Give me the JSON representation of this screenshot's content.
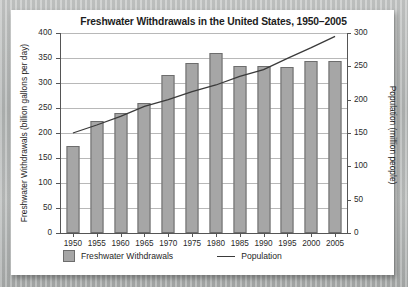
{
  "chart_data": {
    "type": "bar",
    "title": "Freshwater Withdrawals in the United States, 1950–2005",
    "xlabel": "",
    "ylabel": "Freshwater Withdrawals (billion gallons per day)",
    "y2label": "Population (million people)",
    "categories": [
      "1950",
      "1955",
      "1960",
      "1965",
      "1970",
      "1975",
      "1980",
      "1985",
      "1990",
      "1995",
      "2000",
      "2005"
    ],
    "ylim": [
      0,
      400
    ],
    "yticks": [
      0,
      50,
      100,
      150,
      200,
      250,
      300,
      350,
      400
    ],
    "y2lim": [
      0,
      300
    ],
    "y2ticks": [
      0,
      50,
      100,
      150,
      200,
      250,
      300
    ],
    "grid": true,
    "legend_position": "bottom-left",
    "series": [
      {
        "name": "Freshwater Withdrawals",
        "kind": "bar",
        "axis": "left",
        "units": "billion gallons per day",
        "color": "#a6a6a6",
        "values": [
          175,
          225,
          240,
          260,
          317,
          340,
          360,
          335,
          335,
          332,
          345,
          345
        ]
      },
      {
        "name": "Population",
        "kind": "line",
        "axis": "right",
        "units": "million people",
        "color": "#3a3a3a",
        "values": [
          150,
          162,
          175,
          190,
          200,
          212,
          222,
          235,
          245,
          262,
          278,
          295
        ]
      }
    ]
  },
  "legend": {
    "bars_label": "Freshwater Withdrawals",
    "line_label": "Population"
  }
}
